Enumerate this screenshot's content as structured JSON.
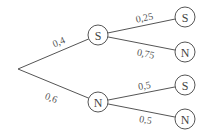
{
  "diagram": {
    "type": "probability-tree",
    "root": {
      "x": 18,
      "y": 69
    },
    "level1": [
      {
        "id": "s1",
        "label": "S",
        "x": 98,
        "y": 35,
        "edge_label": "0,4",
        "lx": 60,
        "ly": 45,
        "rot": -23
      },
      {
        "id": "n1",
        "label": "N",
        "x": 98,
        "y": 102,
        "edge_label": "0,6",
        "lx": 50,
        "ly": 101,
        "rot": 20
      }
    ],
    "level2": [
      {
        "parent": "s1",
        "label": "S",
        "x": 185,
        "y": 17,
        "edge_label": "0,25",
        "lx": 145,
        "ly": 21,
        "rot": -12
      },
      {
        "parent": "s1",
        "label": "N",
        "x": 185,
        "y": 52,
        "edge_label": "0,75",
        "lx": 145,
        "ly": 57,
        "rot": 12
      },
      {
        "parent": "n1",
        "label": "S",
        "x": 185,
        "y": 85,
        "edge_label": "0,5",
        "lx": 145,
        "ly": 89,
        "rot": -10
      },
      {
        "parent": "n1",
        "label": "N",
        "x": 185,
        "y": 119,
        "edge_label": "0,5",
        "lx": 145,
        "ly": 123,
        "rot": 10
      }
    ],
    "node_radius": 10
  }
}
